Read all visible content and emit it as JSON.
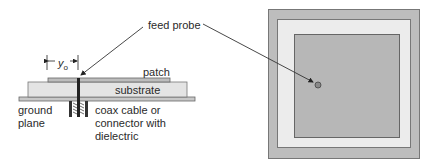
{
  "diagram": {
    "labels": {
      "feed_probe": "feed probe",
      "patch": "patch",
      "substrate": "substrate",
      "ground_plane_1": "ground",
      "ground_plane_2": "plane",
      "coax_1": "coax cable or",
      "coax_2": "connector with",
      "coax_3": "dielectric",
      "y0": "y",
      "y0_sub": "o"
    },
    "colors": {
      "outer_ground": "#bdbdbd",
      "substrate": "#ececec",
      "patch": "#b7b7b7",
      "line": "#555555",
      "probe": "#8a8a8a"
    }
  }
}
